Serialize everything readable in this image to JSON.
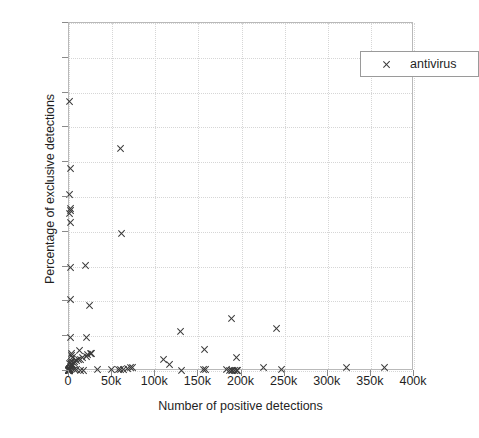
{
  "chart_data": {
    "type": "scatter",
    "title": "",
    "xlabel": "Number of positive detections",
    "ylabel": "Percentage of exclusive detections",
    "xlim": [
      0,
      400000
    ],
    "ylim": [
      0,
      100
    ],
    "grid": true,
    "legend_position": "top-right",
    "xtick_labels": [
      "0",
      "50k",
      "100k",
      "150k",
      "200k",
      "250k",
      "300k",
      "350k",
      "400k"
    ],
    "xtick_values": [
      0,
      50000,
      100000,
      150000,
      200000,
      250000,
      300000,
      350000,
      400000
    ],
    "ytick_labels": [
      "0",
      "10",
      "20",
      "30",
      "40",
      "50",
      "60",
      "70",
      "80",
      "90",
      "100"
    ],
    "ytick_values": [
      0,
      10,
      20,
      30,
      40,
      50,
      60,
      70,
      80,
      90,
      100
    ],
    "series": [
      {
        "name": "antivirus",
        "marker": "x",
        "color": "#3a3a3a",
        "points": [
          [
            1000,
            77.5
          ],
          [
            1500,
            58.3
          ],
          [
            1200,
            50.8
          ],
          [
            1800,
            46.8
          ],
          [
            1500,
            46.0
          ],
          [
            1300,
            45.2
          ],
          [
            1400,
            42.6
          ],
          [
            60000,
            63.9
          ],
          [
            61000,
            39.4
          ],
          [
            2000,
            29.6
          ],
          [
            19000,
            30.3
          ],
          [
            1800,
            20.6
          ],
          [
            24000,
            18.8
          ],
          [
            2200,
            9.6
          ],
          [
            20000,
            9.5
          ],
          [
            129000,
            11.3
          ],
          [
            189000,
            15.2
          ],
          [
            241000,
            12.3
          ],
          [
            157000,
            6.2
          ],
          [
            194000,
            3.9
          ],
          [
            110000,
            3.3
          ],
          [
            117000,
            1.9
          ],
          [
            3000,
            5.0
          ],
          [
            3500,
            4.5
          ],
          [
            4000,
            3.9
          ],
          [
            12000,
            5.8
          ],
          [
            20000,
            4.3
          ],
          [
            22000,
            4.8
          ],
          [
            25000,
            4.9
          ],
          [
            26000,
            5.0
          ],
          [
            16000,
            3.8
          ],
          [
            14000,
            3.4
          ],
          [
            11000,
            3.2
          ],
          [
            9000,
            2.9
          ],
          [
            7000,
            2.6
          ],
          [
            5500,
            2.3
          ],
          [
            4500,
            2.0
          ],
          [
            3000,
            1.8
          ],
          [
            2500,
            1.5
          ],
          [
            2000,
            1.2
          ],
          [
            1500,
            1.0
          ],
          [
            1200,
            0.8
          ],
          [
            1000,
            0.6
          ],
          [
            800,
            0.5
          ],
          [
            600,
            0.4
          ],
          [
            500,
            0.3
          ],
          [
            400,
            0.25
          ],
          [
            300,
            0.2
          ],
          [
            250,
            0.15
          ],
          [
            200,
            0.1
          ],
          [
            150,
            0.08
          ],
          [
            120,
            0.05
          ],
          [
            100,
            0.03
          ],
          [
            80,
            0.02
          ],
          [
            60,
            0.3
          ],
          [
            900,
            2.1
          ],
          [
            1700,
            2.4
          ],
          [
            2800,
            2.7
          ],
          [
            6500,
            0.4
          ],
          [
            8500,
            0.3
          ],
          [
            13000,
            0.2
          ],
          [
            17000,
            0.25
          ],
          [
            33000,
            0.5
          ],
          [
            49000,
            0.3
          ],
          [
            57000,
            0.4
          ],
          [
            60000,
            0.35
          ],
          [
            63000,
            0.45
          ],
          [
            68000,
            0.6
          ],
          [
            72000,
            0.9
          ],
          [
            74000,
            1.1
          ],
          [
            131000,
            0.1
          ],
          [
            156000,
            0.5
          ],
          [
            158000,
            0.3
          ],
          [
            183000,
            0.4
          ],
          [
            186000,
            0.2
          ],
          [
            188000,
            0.15
          ],
          [
            190000,
            0.1
          ],
          [
            192000,
            0.05
          ],
          [
            194000,
            0.1
          ],
          [
            196000,
            0.2
          ],
          [
            226000,
            0.9
          ],
          [
            246000,
            0.3
          ],
          [
            322000,
            1.0
          ],
          [
            366000,
            1.1
          ]
        ]
      }
    ]
  },
  "legend": {
    "entries": [
      {
        "label": "antivirus",
        "marker": "x"
      }
    ]
  },
  "axes": {
    "x_title": "Number of positive detections",
    "y_title": "Percentage of exclusive detections"
  }
}
